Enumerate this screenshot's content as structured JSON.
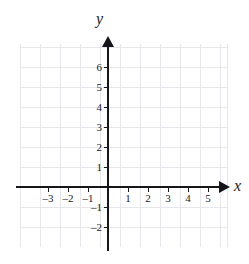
{
  "figure": {
    "type": "coordinate-plane",
    "axis_names": {
      "x": "x",
      "y": "y"
    },
    "colors": {
      "grid": "#e6e6ec",
      "axis": "#15151a",
      "label": "#1a1a1f",
      "background": "#ffffff"
    }
  },
  "chart_data": {
    "type": "scatter",
    "title": "",
    "xlabel": "x",
    "ylabel": "y",
    "grid": true,
    "legend": null,
    "series": [],
    "x": [],
    "y": [],
    "xlim": [
      -4.4,
      6.0
    ],
    "ylim": [
      -3.0,
      7.0
    ],
    "xticks": [
      -3,
      -2,
      -1,
      1,
      2,
      3,
      4,
      5
    ],
    "yticks": [
      -2,
      -1,
      1,
      2,
      3,
      4,
      5,
      6
    ],
    "xtick_labels": [
      "–3",
      "–2",
      "–1",
      "1",
      "2",
      "3",
      "4",
      "5"
    ],
    "ytick_labels": [
      "–2",
      "–1",
      "1",
      "2",
      "3",
      "4",
      "5",
      "6"
    ],
    "annotations": []
  },
  "ticks": {
    "x": [
      {
        "value": -3,
        "label": "–3",
        "px": 48
      },
      {
        "value": -2,
        "label": "–2",
        "px": 68
      },
      {
        "value": -1,
        "label": "–1",
        "px": 88
      },
      {
        "value": 1,
        "label": "1",
        "px": 128
      },
      {
        "value": 2,
        "label": "2",
        "px": 148
      },
      {
        "value": 3,
        "label": "3",
        "px": 168
      },
      {
        "value": 4,
        "label": "4",
        "px": 188
      },
      {
        "value": 5,
        "label": "5",
        "px": 208
      }
    ],
    "y": [
      {
        "value": 6,
        "label": "6",
        "px": 67
      },
      {
        "value": 5,
        "label": "5",
        "px": 87
      },
      {
        "value": 4,
        "label": "4",
        "px": 107
      },
      {
        "value": 3,
        "label": "3",
        "px": 127
      },
      {
        "value": 2,
        "label": "2",
        "px": 147
      },
      {
        "value": 1,
        "label": "1",
        "px": 167
      },
      {
        "value": -1,
        "label": "–1",
        "px": 207
      },
      {
        "value": -2,
        "label": "–2",
        "px": 227
      }
    ]
  }
}
